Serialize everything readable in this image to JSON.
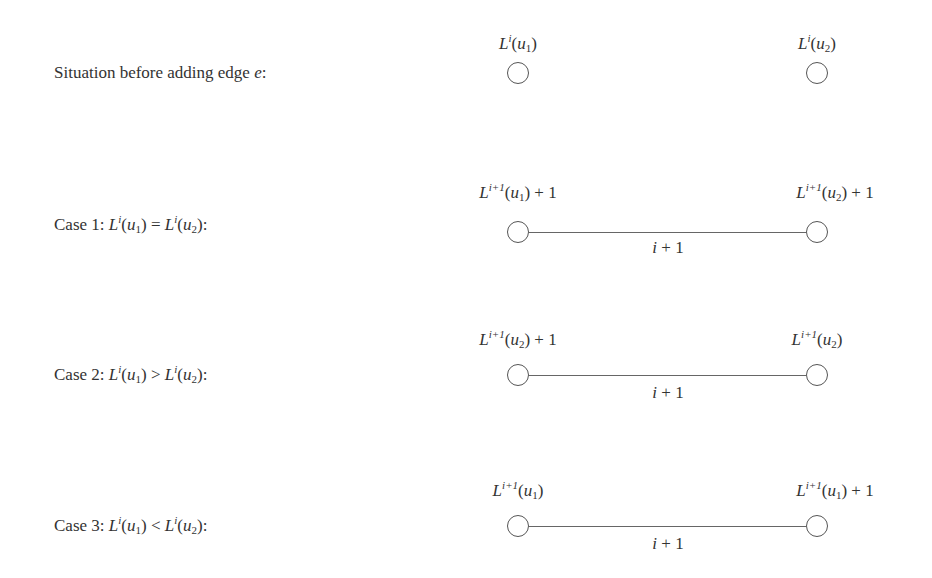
{
  "rows": [
    {
      "label": "Situation before adding edge e:",
      "left_node": "L^i(u_1)",
      "right_node": "L^i(u_2)",
      "has_edge": false
    },
    {
      "label": "Case 1: L^i(u_1) = L^i(u_2):",
      "left_node": "L^{i+1}(u_1) + 1",
      "right_node": "L^{i+1}(u_2) + 1",
      "has_edge": true,
      "edge_label": "i + 1"
    },
    {
      "label": "Case 2: L^i(u_1) > L^i(u_2):",
      "left_node": "L^{i+1}(u_2) + 1",
      "right_node": "L^{i+1}(u_2)",
      "has_edge": true,
      "edge_label": "i + 1"
    },
    {
      "label": "Case 3: L^i(u_1) < L^i(u_2):",
      "left_node": "L^{i+1}(u_1)",
      "right_node": "L^{i+1}(u_1) + 1",
      "has_edge": true,
      "edge_label": "i + 1"
    }
  ],
  "text": {
    "situation": "Situation before adding edge ",
    "e": "e",
    "colon": ":",
    "case1": "Case 1: ",
    "case2": "Case 2: ",
    "case3": "Case 3: ",
    "L": "L",
    "i": "i",
    "ip1": "i+1",
    "u": "u",
    "one": "1",
    "two": "2",
    "lp": "(",
    "rp": ")",
    "eq": " = ",
    "gt": " > ",
    "lt": " < ",
    "plus1": " + 1",
    "edge_i": "i",
    "edge_plus1": " + 1"
  }
}
